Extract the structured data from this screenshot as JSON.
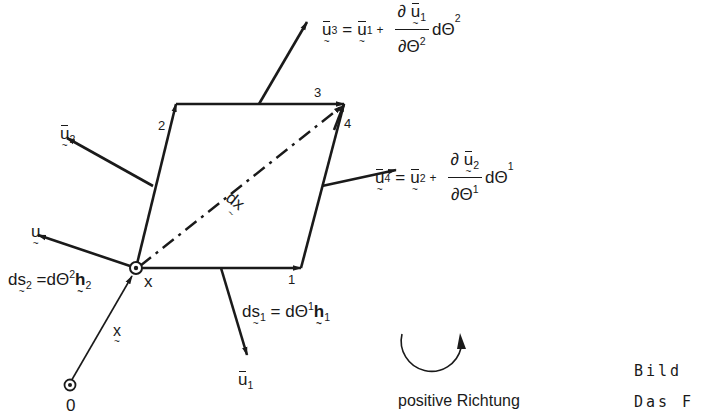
{
  "figure": {
    "colors": {
      "ink": "#1a1a1a",
      "background": "#ffffff"
    },
    "corner_labels": [
      "1",
      "2",
      "3",
      "4"
    ],
    "point_x_label": "x",
    "origin_label": "0",
    "position_vector_label": "x",
    "diagonal_label": "dx",
    "u_label": "u",
    "u1_label": "u",
    "u1_sub": "1",
    "u2_label": "u",
    "u2_sub": "2",
    "eq_u3": {
      "lhs": "u",
      "lhs_sub": "3",
      "eq": "=",
      "rhs": "u",
      "rhs_sub": "1",
      "plus": "+",
      "num_d": "∂",
      "num_u": "u",
      "num_sub": "1",
      "den": "∂Θ",
      "den_sup": "2",
      "diff": "dΘ",
      "diff_sup": "2"
    },
    "eq_u4": {
      "lhs": "u",
      "lhs_sub": "4",
      "eq": "=",
      "rhs": "u",
      "rhs_sub": "2",
      "plus": "+",
      "num_d": "∂",
      "num_u": "u",
      "num_sub": "2",
      "den": "∂Θ",
      "den_sup": "1",
      "diff": "dΘ",
      "diff_sup": "1"
    },
    "eq_ds1": {
      "d": "d",
      "s": "s",
      "sub": "1",
      "eq": "=",
      "dtheta": "dΘ",
      "sup": "1",
      "h": "h",
      "hsub": "1"
    },
    "eq_ds2": {
      "d": "d",
      "s": "s",
      "sub": "2",
      "eq": "=",
      "dtheta": "dΘ",
      "sup": "2",
      "h": "h",
      "hsub": "2"
    },
    "rotation_label": "positive Richtung",
    "caption_line1": "Bild",
    "caption_line2": "Das F"
  }
}
